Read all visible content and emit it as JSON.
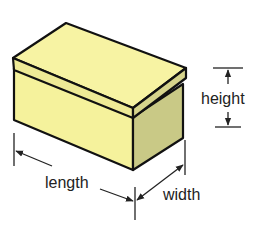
{
  "diagram": {
    "labels": {
      "height": "height",
      "length": "length",
      "width": "width"
    },
    "colors": {
      "box_top": "#f7f3a3",
      "box_front": "#f5f29c",
      "box_side": "#c9c986",
      "lid_band_front": "#eeea96",
      "lid_band_side": "#d6d48c",
      "outline": "#111111",
      "dimension_lines": "#222222"
    }
  }
}
